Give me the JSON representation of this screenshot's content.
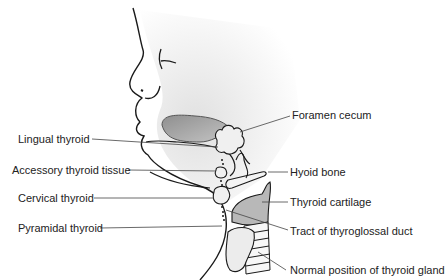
{
  "diagram": {
    "left_labels": [
      {
        "id": "lingual",
        "text": "Lingual thyroid"
      },
      {
        "id": "accessory",
        "text": "Accessory thyroid tissue"
      },
      {
        "id": "cervical",
        "text": "Cervical thyroid"
      },
      {
        "id": "pyramidal",
        "text": "Pyramidal thyroid"
      }
    ],
    "right_labels": [
      {
        "id": "foramen",
        "text": "Foramen cecum"
      },
      {
        "id": "hyoid",
        "text": "Hyoid bone"
      },
      {
        "id": "cartilage",
        "text": "Thyroid cartilage"
      },
      {
        "id": "tract",
        "text": "Tract of thyroglossal duct"
      },
      {
        "id": "normal",
        "text": "Normal position of thyroid gland"
      }
    ],
    "colors": {
      "outline": "#1a1a1a",
      "tongue_fill": "#a9a9a9",
      "skin_shade": "#e6e6e6",
      "gland_fill": "#ececec",
      "cartilage_fill": "#b8b8b8",
      "leader_line": "#444444"
    }
  }
}
